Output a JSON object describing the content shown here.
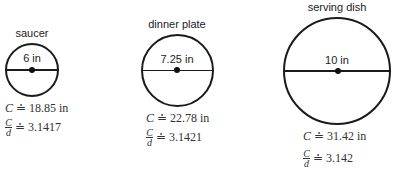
{
  "plates": [
    {
      "name": "saucer",
      "diameter_label": "6 in",
      "circumference_symbol": "C",
      "approx_symbol": "≐",
      "circumference_value": "18.85 in",
      "ratio_numerator": "C",
      "ratio_denominator": "d",
      "ratio_value": "3.1417"
    },
    {
      "name": "dinner plate",
      "diameter_label": "7.25 in",
      "circumference_symbol": "C",
      "approx_symbol": "≐",
      "circumference_value": "22.78 in",
      "ratio_numerator": "C",
      "ratio_denominator": "d",
      "ratio_value": "3.1421"
    },
    {
      "name": "serving dish",
      "diameter_label": "10 in",
      "circumference_symbol": "C",
      "approx_symbol": "≐",
      "circumference_value": "31.42 in",
      "ratio_numerator": "C",
      "ratio_denominator": "d",
      "ratio_value": "3.142"
    }
  ]
}
